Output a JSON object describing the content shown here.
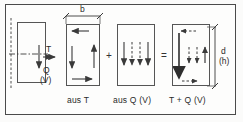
{
  "figure": {
    "type": "engineering-diagram",
    "frame_border_color": "#4a4a4a",
    "line_color": "#3a3a3a",
    "background": "#fdfdfc"
  },
  "dimensions": {
    "width_label": "b",
    "height_label": "d",
    "height_label_alt": "(h)"
  },
  "cross_section": {
    "name": "source-section",
    "force_torsion_label": "T",
    "force_shear_label": "Q",
    "force_shear_label_alt": "(V)"
  },
  "panels": [
    {
      "id": "panel-aus-t",
      "caption": "aus T",
      "flow": "circulatory",
      "arrows": [
        {
          "name": "top-arrow-left",
          "direction": "left",
          "style": "solid"
        },
        {
          "name": "left-arrow-down",
          "direction": "down",
          "style": "solid"
        },
        {
          "name": "right-arrow-up",
          "direction": "up",
          "style": "solid"
        },
        {
          "name": "bottom-arrow-right",
          "direction": "right",
          "style": "solid"
        }
      ]
    },
    {
      "id": "panel-aus-q",
      "caption": "aus Q (V)",
      "flow": "uniform-downward",
      "arrows": [
        {
          "name": "arrow-1-down",
          "direction": "down",
          "style": "solid"
        },
        {
          "name": "arrow-2-down",
          "direction": "down",
          "style": "dashed"
        },
        {
          "name": "arrow-3-down",
          "direction": "down",
          "style": "dashed"
        },
        {
          "name": "arrow-4-down",
          "direction": "down",
          "style": "solid"
        }
      ]
    },
    {
      "id": "panel-sum",
      "caption": "T + Q (V)",
      "flow": "superposed",
      "arrows": [
        {
          "name": "left-arrow-down-thick",
          "direction": "down",
          "style": "solid-thick"
        },
        {
          "name": "mid-arrow-1-down",
          "direction": "down",
          "style": "dashed"
        },
        {
          "name": "mid-arrow-2-down",
          "direction": "down",
          "style": "dashed"
        },
        {
          "name": "right-arrow-up-short",
          "direction": "up",
          "style": "solid"
        },
        {
          "name": "top-arrow-left",
          "direction": "left",
          "style": "dashed"
        },
        {
          "name": "bottom-arrow-right",
          "direction": "right",
          "style": "dashed"
        }
      ]
    }
  ],
  "operators": {
    "plus": "+",
    "equals": "="
  }
}
